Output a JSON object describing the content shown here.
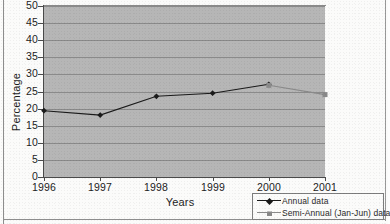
{
  "chart_data": {
    "type": "line",
    "title": "",
    "xlabel": "Years",
    "ylabel": "Percentage",
    "categories": [
      "1996",
      "1997",
      "1998",
      "1999",
      "2000",
      "2001"
    ],
    "ylim": [
      0,
      50
    ],
    "ytick_step": 5,
    "yticks": [
      "50",
      "45",
      "40",
      "35",
      "30",
      "25",
      "20",
      "15",
      "10",
      "5",
      "0"
    ],
    "grid": true,
    "legend_position": "bottom-right",
    "plot_background": "#b6b6b6",
    "series": [
      {
        "name": "Annual data",
        "marker": "diamond",
        "color": "#1a1a1a",
        "values": [
          19.4,
          18.1,
          23.6,
          24.5,
          27.1,
          null
        ]
      },
      {
        "name": "Semi-Annual (Jan-Jun) data",
        "marker": "square",
        "color": "#8a8a8a",
        "values": [
          null,
          null,
          null,
          null,
          26.8,
          24.1
        ]
      }
    ]
  },
  "axes": {
    "y_title": "Percentage",
    "x_title": "Years",
    "y_ticks": [
      "50",
      "45",
      "40",
      "35",
      "30",
      "25",
      "20",
      "15",
      "10",
      "5",
      "0"
    ],
    "x_ticks": [
      "1996",
      "1997",
      "1998",
      "1999",
      "2000",
      "2001"
    ]
  },
  "legend": {
    "entries": [
      {
        "label": "Annual data",
        "marker": "diamond-marker",
        "color": "#1a1a1a"
      },
      {
        "label": "Semi-Annual (Jan-Jun) data",
        "marker": "square-marker",
        "color": "#8a8a8a"
      }
    ]
  }
}
